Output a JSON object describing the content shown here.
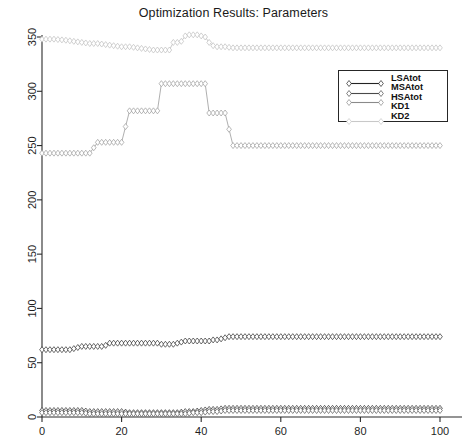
{
  "chart_data": {
    "type": "line",
    "title": "Optimization Results: Parameters",
    "xlabel": "",
    "ylabel": "",
    "xlim": [
      0,
      100
    ],
    "ylim": [
      0,
      360
    ],
    "xticks": [
      0,
      20,
      40,
      60,
      80,
      100
    ],
    "yticks": [
      0,
      50,
      100,
      150,
      200,
      250,
      300,
      350
    ],
    "grid": false,
    "legend_position": "upper right",
    "marker": "diamond-open",
    "series": [
      {
        "name": "LSAtot",
        "color": "#2b2b2b",
        "x": [
          0,
          1,
          2,
          3,
          4,
          5,
          6,
          7,
          8,
          9,
          10,
          11,
          12,
          13,
          14,
          15,
          16,
          17,
          18,
          19,
          20,
          21,
          22,
          23,
          24,
          25,
          26,
          27,
          28,
          29,
          30,
          31,
          32,
          33,
          34,
          35,
          36,
          37,
          38,
          39,
          40,
          41,
          42,
          43,
          44,
          45,
          46,
          47,
          48,
          49,
          50,
          52,
          55,
          58,
          60,
          65,
          70,
          75,
          80,
          85,
          90,
          95,
          100
        ],
        "values": [
          62,
          62,
          62,
          62,
          62,
          62,
          62,
          62,
          63,
          64,
          65,
          65,
          65,
          65,
          65,
          65,
          66,
          68,
          68,
          68,
          68,
          68,
          68,
          68,
          68,
          68,
          68,
          68,
          68,
          68,
          67,
          67,
          67,
          67,
          68,
          69,
          70,
          70,
          70,
          70,
          70,
          70,
          70,
          71,
          71,
          72,
          73,
          74,
          74,
          74,
          74,
          74,
          74,
          74,
          74,
          74,
          74,
          74,
          74,
          74,
          74,
          74,
          74
        ]
      },
      {
        "name": "MSAtot",
        "color": "#2b2b2b",
        "x": [
          0,
          2,
          4,
          6,
          8,
          10,
          12,
          14,
          16,
          18,
          20,
          22,
          24,
          26,
          28,
          30,
          32,
          34,
          36,
          38,
          40,
          42,
          44,
          46,
          48,
          50,
          55,
          60,
          65,
          70,
          75,
          80,
          85,
          90,
          95,
          100
        ],
        "values": [
          6,
          6,
          6,
          6,
          6,
          6,
          5,
          5,
          5,
          5,
          5,
          4,
          4,
          4,
          4,
          4,
          4,
          4,
          5,
          5,
          6,
          7,
          7,
          8,
          8,
          8,
          8,
          8,
          8,
          8,
          8,
          8,
          8,
          8,
          8,
          8
        ]
      },
      {
        "name": "HSAtot",
        "color": "#555555",
        "x": [
          0,
          2,
          4,
          6,
          8,
          10,
          12,
          14,
          16,
          18,
          20,
          22,
          24,
          26,
          28,
          30,
          32,
          34,
          36,
          38,
          40,
          42,
          44,
          46,
          48,
          50,
          55,
          60,
          65,
          70,
          75,
          80,
          85,
          90,
          95,
          100
        ],
        "values": [
          4,
          4,
          4,
          4,
          4,
          4,
          3,
          3,
          3,
          3,
          3,
          3,
          3,
          3,
          3,
          3,
          3,
          3,
          3,
          4,
          4,
          5,
          5,
          6,
          6,
          6,
          6,
          6,
          6,
          6,
          6,
          6,
          6,
          6,
          6,
          6
        ]
      },
      {
        "name": "KD1",
        "color": "#9a9a9a",
        "x": [
          0,
          3,
          6,
          9,
          12,
          14,
          15,
          17,
          20,
          22,
          23,
          26,
          29,
          30,
          31,
          33,
          35,
          36,
          38,
          40,
          41,
          42,
          43,
          44,
          46,
          48,
          49,
          50,
          55,
          60,
          65,
          70,
          75,
          80,
          85,
          90,
          95,
          100
        ],
        "values": [
          243,
          243,
          243,
          243,
          243,
          253,
          253,
          253,
          253,
          282,
          282,
          282,
          282,
          307,
          307,
          307,
          307,
          307,
          307,
          307,
          307,
          280,
          280,
          280,
          280,
          250,
          250,
          250,
          250,
          250,
          250,
          250,
          250,
          250,
          250,
          250,
          250,
          250
        ]
      },
      {
        "name": "KD2",
        "color": "#bdbdbd",
        "x": [
          0,
          3,
          6,
          8,
          10,
          12,
          14,
          16,
          18,
          20,
          22,
          24,
          26,
          28,
          30,
          32,
          33,
          34,
          35,
          36,
          37,
          38,
          39,
          40,
          41,
          42,
          43,
          44,
          46,
          48,
          50,
          55,
          60,
          65,
          70,
          75,
          80,
          85,
          90,
          95,
          100
        ],
        "values": [
          348,
          348,
          347,
          346,
          345,
          344,
          344,
          343,
          342,
          341,
          341,
          340,
          339,
          338,
          338,
          338,
          345,
          345,
          346,
          351,
          352,
          352,
          352,
          351,
          350,
          345,
          342,
          341,
          341,
          340,
          340,
          340,
          340,
          340,
          340,
          340,
          340,
          340,
          340,
          340,
          340
        ]
      }
    ]
  },
  "legend": {
    "entries": [
      {
        "label": "LSAtot",
        "color": "#222222"
      },
      {
        "label": "MSAtot",
        "color": "#4a4a4a"
      },
      {
        "label": "HSAtot",
        "color": "#8a8a8a"
      },
      {
        "label": "KD1",
        "color": "#ffffff"
      },
      {
        "label": "KD2",
        "color": "#c8c8c8"
      }
    ]
  },
  "axes": {
    "x_tick_labels": [
      "0",
      "20",
      "40",
      "60",
      "80",
      "100"
    ],
    "y_tick_labels": [
      "0",
      "50",
      "100",
      "150",
      "200",
      "250",
      "300",
      "350"
    ]
  }
}
